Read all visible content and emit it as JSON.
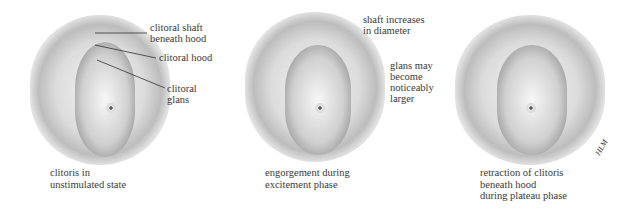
{
  "figure": {
    "panels": [
      {
        "id": "unstimulated",
        "caption": "clitoris in\nunstimulated state",
        "labels": [
          {
            "text": "clitoral shaft\nbeneath hood"
          },
          {
            "text": "clitoral hood"
          },
          {
            "text": "clitoral\nglans"
          }
        ]
      },
      {
        "id": "excitement",
        "caption": "engorgement during\nexcitement phase",
        "labels": [
          {
            "text": "shaft increases\nin diameter"
          },
          {
            "text": "glans may\nbecome\nnoticeably\nlarger"
          }
        ]
      },
      {
        "id": "plateau",
        "caption": "retraction of clitoris\nbeneath hood\nduring plateau phase",
        "signature": "HLM"
      }
    ]
  }
}
